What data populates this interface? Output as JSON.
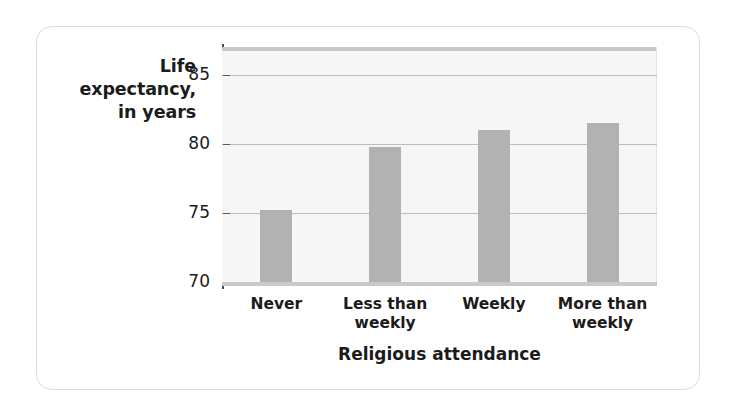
{
  "figure": {
    "frame_color": "#dcdcdc",
    "background": "#ffffff"
  },
  "chart_data": {
    "type": "bar",
    "title": "",
    "categories": [
      "Never",
      "Less than weekly",
      "Weekly",
      "More than weekly"
    ],
    "category_lines": [
      [
        "Never"
      ],
      [
        "Less than",
        "weekly"
      ],
      [
        "Weekly"
      ],
      [
        "More than",
        "weekly"
      ]
    ],
    "values": [
      75.2,
      79.8,
      81.0,
      81.5
    ],
    "xlabel": "Religious attendance",
    "ylabel": "Life expectancy, in years",
    "ylabel_lines": [
      "Life",
      "expectancy,",
      "in years"
    ],
    "ylim": [
      70,
      87
    ],
    "yticks": [
      70,
      75,
      80,
      85
    ],
    "ytick_labels": [
      "70",
      "75",
      "80",
      "85"
    ],
    "grid": true,
    "legend": "none",
    "bar_color": "#b2b2b2",
    "plot_background": "#f6f6f6",
    "gridline_color": "#bdbdbd"
  }
}
